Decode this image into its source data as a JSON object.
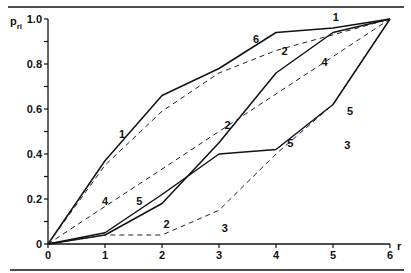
{
  "chart_data": {
    "type": "line",
    "title": "",
    "xlabel": "r",
    "ylabel": "p_ri",
    "ylabel_main": "p",
    "ylabel_sub": "ri",
    "xlim": [
      0,
      6
    ],
    "ylim": [
      0,
      1.0
    ],
    "grid": false,
    "legend": "none (curves labelled inline with numbers 1-6)",
    "x": [
      0,
      1,
      2,
      3,
      4,
      5,
      6
    ],
    "x_ticks": [
      "0",
      "1",
      "2",
      "3",
      "4",
      "5",
      "6"
    ],
    "y_ticks": [
      {
        "value": 0,
        "label": "0"
      },
      {
        "value": 0.1,
        "label": ""
      },
      {
        "value": 0.2,
        "label": "0.2"
      },
      {
        "value": 0.3,
        "label": ""
      },
      {
        "value": 0.4,
        "label": "0.4"
      },
      {
        "value": 0.5,
        "label": ""
      },
      {
        "value": 0.6,
        "label": "0.6"
      },
      {
        "value": 0.7,
        "label": ""
      },
      {
        "value": 0.8,
        "label": "0.8"
      },
      {
        "value": 0.9,
        "label": ""
      },
      {
        "value": 1.0,
        "label": "1.0"
      }
    ],
    "series": [
      {
        "name": "1",
        "style": "solid",
        "values": [
          0,
          0.37,
          0.66,
          0.78,
          0.94,
          0.96,
          1.0
        ],
        "labels": [
          {
            "text": "1",
            "x": 1.3,
            "y": 0.49
          },
          {
            "text": "1",
            "x": 5.05,
            "y": 1.01
          }
        ]
      },
      {
        "name": "2",
        "style": "solid",
        "values": [
          0,
          0.04,
          0.18,
          0.45,
          0.76,
          0.94,
          1.0
        ],
        "labels": [
          {
            "text": "2",
            "x": 2.08,
            "y": 0.09
          },
          {
            "text": "2",
            "x": 3.15,
            "y": 0.53
          },
          {
            "text": "2",
            "x": 4.15,
            "y": 0.86
          }
        ]
      },
      {
        "name": "3",
        "style": "dashed",
        "values": [
          0,
          0.04,
          0.04,
          0.15,
          0.4,
          0.62,
          1.0
        ],
        "labels": [
          {
            "text": "3",
            "x": 3.1,
            "y": 0.07
          },
          {
            "text": "3",
            "x": 5.25,
            "y": 0.44
          }
        ]
      },
      {
        "name": "4",
        "style": "dashed",
        "values": [
          0,
          0.167,
          0.333,
          0.5,
          0.667,
          0.833,
          1.0
        ],
        "labels": [
          {
            "text": "4",
            "x": 1.0,
            "y": 0.19
          },
          {
            "text": "4",
            "x": 4.85,
            "y": 0.81
          }
        ]
      },
      {
        "name": "5",
        "style": "solid",
        "values": [
          0,
          0.05,
          0.22,
          0.4,
          0.42,
          0.62,
          1.0
        ],
        "labels": [
          {
            "text": "5",
            "x": 1.6,
            "y": 0.19
          },
          {
            "text": "5",
            "x": 4.25,
            "y": 0.45
          },
          {
            "text": "5",
            "x": 5.3,
            "y": 0.59
          }
        ]
      },
      {
        "name": "6",
        "style": "dashed",
        "values": [
          0,
          0.35,
          0.59,
          0.76,
          0.86,
          0.93,
          1.0
        ],
        "labels": [
          {
            "text": "6",
            "x": 3.65,
            "y": 0.91
          }
        ]
      }
    ]
  }
}
